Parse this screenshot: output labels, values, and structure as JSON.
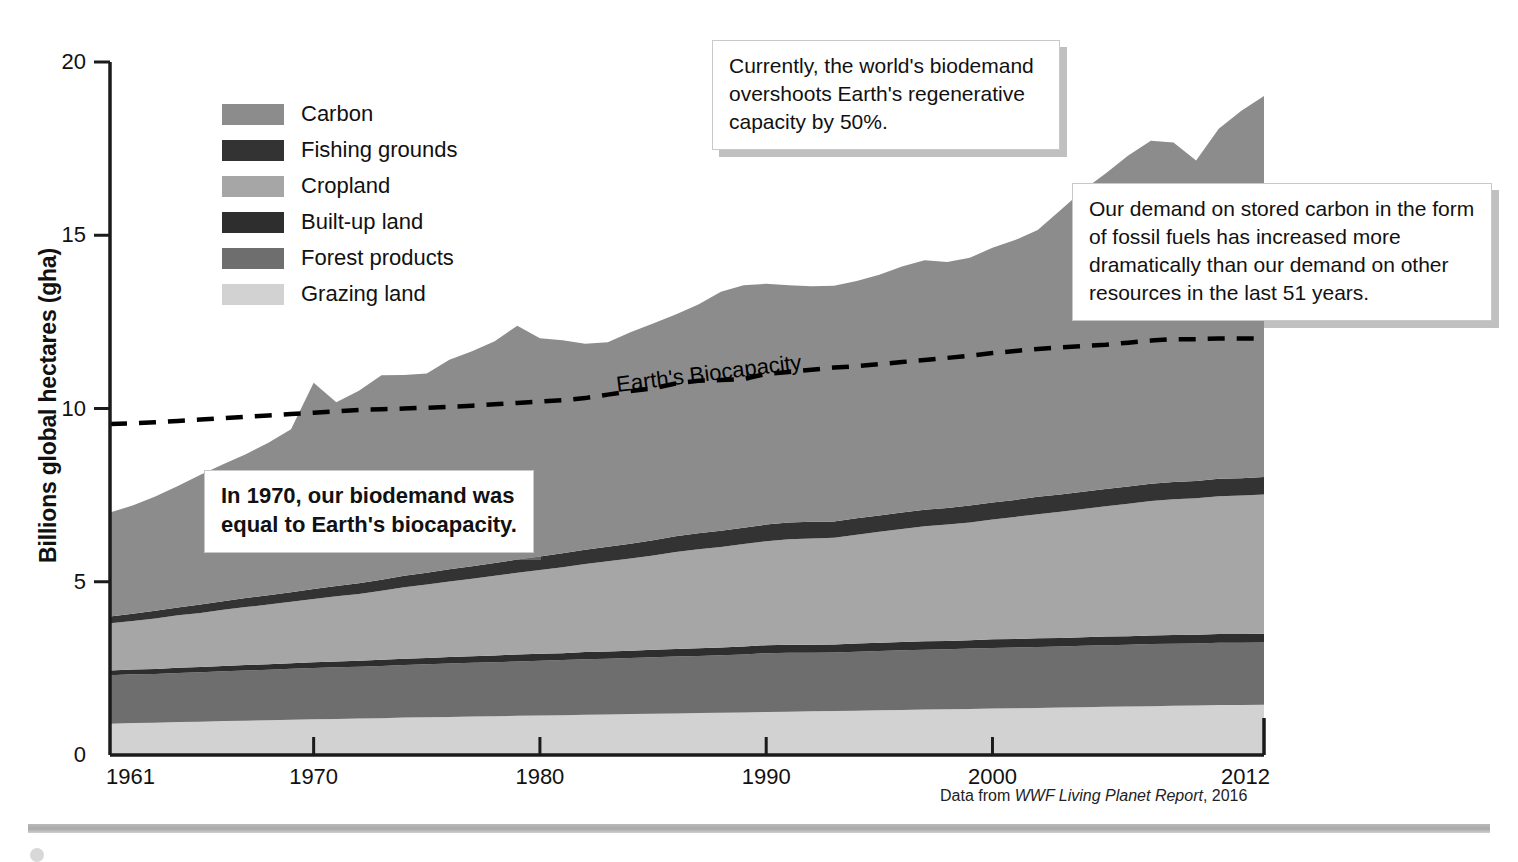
{
  "figure": {
    "source_prefix": "Data from ",
    "source_title": "WWF Living Planet Report",
    "source_suffix": ", 2016"
  },
  "axes": {
    "ylabel": "Billions global hectares (gha)",
    "yticks": [
      "0",
      "5",
      "10",
      "15",
      "20"
    ],
    "xticks": [
      "1961",
      "1970",
      "1980",
      "1990",
      "2000",
      "2012"
    ]
  },
  "legend": {
    "items": [
      {
        "label": "Carbon",
        "color": "#8c8c8c"
      },
      {
        "label": "Fishing grounds",
        "color": "#333333"
      },
      {
        "label": "Cropland",
        "color": "#a6a6a6"
      },
      {
        "label": "Built-up land",
        "color": "#2e2e2e"
      },
      {
        "label": "Forest products",
        "color": "#6e6e6e"
      },
      {
        "label": "Grazing land",
        "color": "#d2d2d2"
      }
    ]
  },
  "annotations": {
    "biocapacity_label": "Earth's Biocapacity",
    "callout_overshoot": "Currently, the world's biodemand overshoots Earth's regenerative capacity by 50%.",
    "callout_carbon": "Our demand on stored carbon in the form of fossil fuels has increased more dramatically than our demand on other resources in the last 51 years.",
    "callout_1970": "In 1970, our biodemand was equal to Earth's biocapacity."
  },
  "chart_data": {
    "type": "area",
    "title": "",
    "xlabel": "",
    "ylabel": "Billions global hectares (gha)",
    "xlim": [
      1961,
      2012
    ],
    "ylim": [
      0,
      20
    ],
    "grid": false,
    "legend_position": "upper-left-inside",
    "stacked": true,
    "stack_order_bottom_to_top": [
      "Grazing land",
      "Forest products",
      "Built-up land",
      "Cropland",
      "Fishing grounds",
      "Carbon"
    ],
    "x": [
      1961,
      1962,
      1963,
      1964,
      1965,
      1966,
      1967,
      1968,
      1969,
      1970,
      1971,
      1972,
      1973,
      1974,
      1975,
      1976,
      1977,
      1978,
      1979,
      1980,
      1981,
      1982,
      1983,
      1984,
      1985,
      1986,
      1987,
      1988,
      1989,
      1990,
      1991,
      1992,
      1993,
      1994,
      1995,
      1996,
      1997,
      1998,
      1999,
      2000,
      2001,
      2002,
      2003,
      2004,
      2005,
      2006,
      2007,
      2008,
      2009,
      2010,
      2011,
      2012
    ],
    "series": [
      {
        "name": "Grazing land",
        "color": "#d2d2d2",
        "values": [
          0.9,
          0.92,
          0.93,
          0.95,
          0.96,
          0.98,
          0.99,
          1.0,
          1.02,
          1.03,
          1.04,
          1.05,
          1.06,
          1.08,
          1.09,
          1.1,
          1.11,
          1.12,
          1.13,
          1.14,
          1.15,
          1.16,
          1.17,
          1.18,
          1.19,
          1.2,
          1.21,
          1.22,
          1.23,
          1.24,
          1.25,
          1.26,
          1.27,
          1.28,
          1.29,
          1.3,
          1.31,
          1.32,
          1.33,
          1.34,
          1.35,
          1.36,
          1.37,
          1.38,
          1.39,
          1.4,
          1.41,
          1.42,
          1.43,
          1.44,
          1.44,
          1.45
        ]
      },
      {
        "name": "Forest products",
        "color": "#6e6e6e",
        "values": [
          1.4,
          1.41,
          1.41,
          1.42,
          1.43,
          1.44,
          1.45,
          1.46,
          1.47,
          1.48,
          1.49,
          1.5,
          1.51,
          1.52,
          1.53,
          1.54,
          1.55,
          1.56,
          1.57,
          1.58,
          1.59,
          1.6,
          1.61,
          1.62,
          1.63,
          1.64,
          1.65,
          1.66,
          1.67,
          1.7,
          1.7,
          1.69,
          1.69,
          1.7,
          1.71,
          1.72,
          1.73,
          1.73,
          1.74,
          1.75,
          1.75,
          1.76,
          1.76,
          1.77,
          1.78,
          1.78,
          1.79,
          1.79,
          1.79,
          1.8,
          1.8,
          1.8
        ]
      },
      {
        "name": "Built-up land",
        "color": "#2e2e2e",
        "values": [
          0.14,
          0.14,
          0.14,
          0.15,
          0.15,
          0.15,
          0.16,
          0.16,
          0.16,
          0.17,
          0.17,
          0.17,
          0.18,
          0.18,
          0.18,
          0.19,
          0.19,
          0.19,
          0.2,
          0.2,
          0.2,
          0.21,
          0.21,
          0.21,
          0.22,
          0.22,
          0.22,
          0.22,
          0.23,
          0.23,
          0.23,
          0.23,
          0.23,
          0.24,
          0.24,
          0.24,
          0.24,
          0.24,
          0.24,
          0.25,
          0.25,
          0.25,
          0.25,
          0.25,
          0.25,
          0.25,
          0.25,
          0.25,
          0.25,
          0.25,
          0.25,
          0.25
        ]
      },
      {
        "name": "Cropland",
        "color": "#a6a6a6",
        "values": [
          1.36,
          1.4,
          1.46,
          1.51,
          1.56,
          1.62,
          1.67,
          1.72,
          1.77,
          1.82,
          1.88,
          1.93,
          1.99,
          2.06,
          2.12,
          2.18,
          2.24,
          2.3,
          2.36,
          2.42,
          2.48,
          2.54,
          2.6,
          2.66,
          2.72,
          2.8,
          2.86,
          2.9,
          2.96,
          3.0,
          3.05,
          3.07,
          3.08,
          3.14,
          3.2,
          3.26,
          3.32,
          3.36,
          3.4,
          3.46,
          3.52,
          3.58,
          3.64,
          3.7,
          3.76,
          3.82,
          3.88,
          3.92,
          3.94,
          3.98,
          4.0,
          4.02
        ]
      },
      {
        "name": "Fishing grounds",
        "color": "#333333",
        "values": [
          0.2,
          0.21,
          0.22,
          0.23,
          0.24,
          0.25,
          0.26,
          0.27,
          0.28,
          0.29,
          0.3,
          0.31,
          0.32,
          0.33,
          0.34,
          0.35,
          0.36,
          0.37,
          0.38,
          0.39,
          0.4,
          0.41,
          0.42,
          0.43,
          0.44,
          0.45,
          0.46,
          0.47,
          0.47,
          0.48,
          0.48,
          0.48,
          0.47,
          0.47,
          0.47,
          0.48,
          0.48,
          0.48,
          0.49,
          0.49,
          0.49,
          0.5,
          0.5,
          0.5,
          0.5,
          0.5,
          0.5,
          0.5,
          0.5,
          0.5,
          0.5,
          0.5
        ]
      },
      {
        "name": "Carbon",
        "color": "#8c8c8c",
        "values": [
          3.0,
          3.12,
          3.3,
          3.5,
          3.75,
          3.95,
          4.15,
          4.4,
          4.7,
          5.95,
          5.3,
          5.55,
          5.9,
          5.8,
          5.75,
          6.05,
          6.2,
          6.4,
          6.75,
          6.3,
          6.15,
          5.95,
          5.9,
          6.1,
          6.25,
          6.4,
          6.6,
          6.9,
          7.0,
          6.95,
          6.85,
          6.8,
          6.8,
          6.85,
          6.95,
          7.1,
          7.2,
          7.1,
          7.15,
          7.35,
          7.5,
          7.7,
          8.2,
          8.7,
          9.1,
          9.55,
          9.9,
          9.8,
          9.25,
          10.1,
          10.6,
          11.0
        ]
      }
    ],
    "reference_line": {
      "name": "Earth's Biocapacity",
      "style": "dashed",
      "color": "#000000",
      "values": [
        9.55,
        9.57,
        9.6,
        9.64,
        9.68,
        9.72,
        9.76,
        9.8,
        9.84,
        9.88,
        9.92,
        9.96,
        9.98,
        10.0,
        10.02,
        10.05,
        10.08,
        10.12,
        10.16,
        10.2,
        10.24,
        10.3,
        10.4,
        10.5,
        10.58,
        10.72,
        10.8,
        10.82,
        10.85,
        11.0,
        11.05,
        11.12,
        11.18,
        11.22,
        11.28,
        11.34,
        11.4,
        11.46,
        11.52,
        11.6,
        11.66,
        11.72,
        11.76,
        11.8,
        11.84,
        11.9,
        11.96,
        12.0,
        12.0,
        12.02,
        12.02,
        12.02
      ]
    }
  }
}
